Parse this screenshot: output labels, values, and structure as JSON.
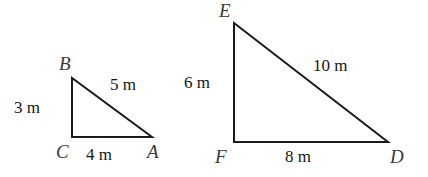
{
  "figure": {
    "background_color": "#ffffff",
    "stroke_color": "#1b1b1b",
    "vertex_label_color": "#3a3a3a",
    "measure_label_color": "#141414",
    "stroke_width": 2,
    "unit": "m",
    "triangles": [
      {
        "name": "triangle-abc",
        "vertices": [
          {
            "label": "A",
            "x": 152,
            "y": 137
          },
          {
            "label": "B",
            "x": 72,
            "y": 78
          },
          {
            "label": "C",
            "x": 72,
            "y": 137
          }
        ],
        "sides": [
          {
            "name": "side-bc",
            "label": "3 m",
            "value": 3,
            "unit": "m"
          },
          {
            "name": "side-ab",
            "label": "5 m",
            "value": 5,
            "unit": "m"
          },
          {
            "name": "side-ca",
            "label": "4 m",
            "value": 4,
            "unit": "m"
          }
        ]
      },
      {
        "name": "triangle-def",
        "vertices": [
          {
            "label": "D",
            "x": 388,
            "y": 142
          },
          {
            "label": "E",
            "x": 234,
            "y": 23
          },
          {
            "label": "F",
            "x": 234,
            "y": 142
          }
        ],
        "sides": [
          {
            "name": "side-ef",
            "label": "6 m",
            "value": 6,
            "unit": "m"
          },
          {
            "name": "side-ed",
            "label": "10 m",
            "value": 10,
            "unit": "m"
          },
          {
            "name": "side-fd",
            "label": "8 m",
            "value": 8,
            "unit": "m"
          }
        ]
      }
    ],
    "labels": {
      "vertex_b": "B",
      "vertex_c": "C",
      "vertex_a": "A",
      "vertex_e": "E",
      "vertex_f": "F",
      "vertex_d": "D",
      "measure_3m": "3 m",
      "measure_5m": "5 m",
      "measure_4m": "4 m",
      "measure_6m": "6 m",
      "measure_10m": "10 m",
      "measure_8m": "8 m"
    }
  }
}
